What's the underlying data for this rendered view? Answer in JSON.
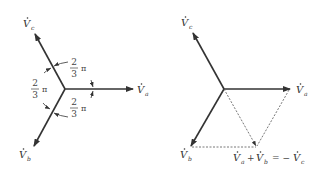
{
  "left_diagram": {
    "labels": {
      "va": "V",
      "va_sub": "a",
      "vb": "V",
      "vb_sub": "b",
      "vc": "V",
      "vc_sub": "c"
    },
    "angles": [
      {
        "num": "2",
        "den": "3",
        "sym": "π"
      },
      {
        "num": "2",
        "den": "3",
        "sym": "π"
      },
      {
        "num": "2",
        "den": "3",
        "sym": "π"
      }
    ]
  },
  "right_diagram": {
    "labels": {
      "va": "V",
      "va_sub": "a",
      "vb": "V",
      "vb_sub": "b",
      "vc": "V",
      "vc_sub": "c"
    },
    "sum_label": {
      "t1": "V",
      "t1_sub": "a",
      "plus": "+",
      "t2": "V",
      "t2_sub": "b",
      "eq": "= −",
      "t3": "V",
      "t3_sub": "c"
    }
  },
  "colors": {
    "vector": "#333333",
    "dashed": "#555555",
    "text": "#333333"
  }
}
